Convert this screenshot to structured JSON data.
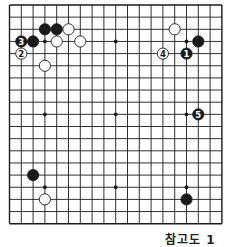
{
  "diagram": {
    "type": "go-board",
    "size": 19,
    "caption": "참고도 1",
    "origin": {
      "x": 9.5,
      "y": 5
    },
    "spacing": {
      "x": 11.8,
      "y": 12.15
    },
    "colors": {
      "line": "#1a1a1a",
      "black": "#1a1a1a",
      "white": "#ffffff",
      "background": "#ffffff"
    },
    "star_points": [
      [
        3,
        3
      ],
      [
        9,
        3
      ],
      [
        15,
        3
      ],
      [
        3,
        9
      ],
      [
        9,
        9
      ],
      [
        15,
        9
      ],
      [
        3,
        15
      ],
      [
        9,
        15
      ],
      [
        15,
        15
      ]
    ],
    "stones": [
      {
        "color": "black",
        "col": 3,
        "row": 2,
        "label": ""
      },
      {
        "color": "black",
        "col": 4,
        "row": 2,
        "label": ""
      },
      {
        "color": "white",
        "col": 5,
        "row": 2,
        "label": ""
      },
      {
        "color": "black",
        "col": 1,
        "row": 3,
        "label": "3"
      },
      {
        "color": "black",
        "col": 2,
        "row": 3,
        "label": ""
      },
      {
        "color": "white",
        "col": 4,
        "row": 3,
        "label": ""
      },
      {
        "color": "white",
        "col": 6,
        "row": 3,
        "label": ""
      },
      {
        "color": "white",
        "col": 1,
        "row": 4,
        "label": "2"
      },
      {
        "color": "white",
        "col": 3,
        "row": 5,
        "label": ""
      },
      {
        "color": "white",
        "col": 14,
        "row": 2,
        "label": ""
      },
      {
        "color": "black",
        "col": 16,
        "row": 3,
        "label": ""
      },
      {
        "color": "black",
        "col": 15,
        "row": 4,
        "label": "1"
      },
      {
        "color": "white",
        "col": 13,
        "row": 4,
        "label": "4"
      },
      {
        "color": "black",
        "col": 16,
        "row": 9,
        "label": "5"
      },
      {
        "color": "black",
        "col": 2,
        "row": 14,
        "label": ""
      },
      {
        "color": "white",
        "col": 3,
        "row": 16,
        "label": ""
      },
      {
        "color": "black",
        "col": 15,
        "row": 16,
        "label": ""
      }
    ]
  }
}
